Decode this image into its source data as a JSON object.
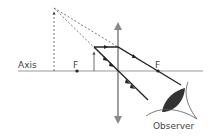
{
  "diagram": {
    "type": "converging-lens-magnifier",
    "labels": {
      "axis": "Axis",
      "focal_left": "F",
      "focal_right": "F",
      "observer": "Observer"
    },
    "colors": {
      "line": "#2a2a2a",
      "lens": "#888888",
      "eye": "#333333"
    }
  }
}
